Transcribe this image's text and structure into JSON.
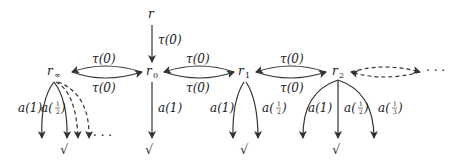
{
  "diagram": {
    "type": "labeled-transition-system",
    "nodes": [
      {
        "id": "r",
        "label": "r"
      },
      {
        "id": "r_inf",
        "label": "r",
        "subscript": "∞"
      },
      {
        "id": "r0",
        "label": "r",
        "subscript": "0"
      },
      {
        "id": "r1",
        "label": "r",
        "subscript": "1"
      },
      {
        "id": "r2",
        "label": "r",
        "subscript": "2"
      }
    ],
    "edge_labels": {
      "tau0": "τ(0)",
      "a1": "a(1)",
      "a_half_prefix": "a(",
      "a_suffix": ")",
      "half_num": "1",
      "half_den": "2",
      "third_den": "3"
    },
    "terminal": "√",
    "ellipsis": "· · ·",
    "edges": [
      {
        "from": "r",
        "to": "r0",
        "label": "τ(0)"
      },
      {
        "from": "r0",
        "to": "r_inf",
        "label": "τ(0)"
      },
      {
        "from": "r_inf",
        "to": "r0",
        "label": "τ(0)"
      },
      {
        "from": "r0",
        "to": "r1",
        "label": "τ(0)"
      },
      {
        "from": "r1",
        "to": "r0",
        "label": "τ(0)"
      },
      {
        "from": "r1",
        "to": "r2",
        "label": "τ(0)"
      },
      {
        "from": "r2",
        "to": "r1",
        "label": "τ(0)"
      },
      {
        "from": "r2",
        "to": "...",
        "label": "",
        "style": "dashed"
      },
      {
        "from": "r0",
        "to": "√",
        "label": "a(1)"
      },
      {
        "from": "r1",
        "to": "√",
        "label": "a(1)"
      },
      {
        "from": "r1",
        "to": "√",
        "label": "a(1/2)"
      },
      {
        "from": "r2",
        "to": "√",
        "label": "a(1)"
      },
      {
        "from": "r2",
        "to": "√",
        "label": "a(1/2)"
      },
      {
        "from": "r2",
        "to": "√",
        "label": "a(1/3)"
      },
      {
        "from": "r_inf",
        "to": "√",
        "label": "a(1)"
      },
      {
        "from": "r_inf",
        "to": "√",
        "label": "a(1/2)"
      },
      {
        "from": "r_inf",
        "to": "...",
        "label": "",
        "style": "dashed"
      }
    ]
  }
}
